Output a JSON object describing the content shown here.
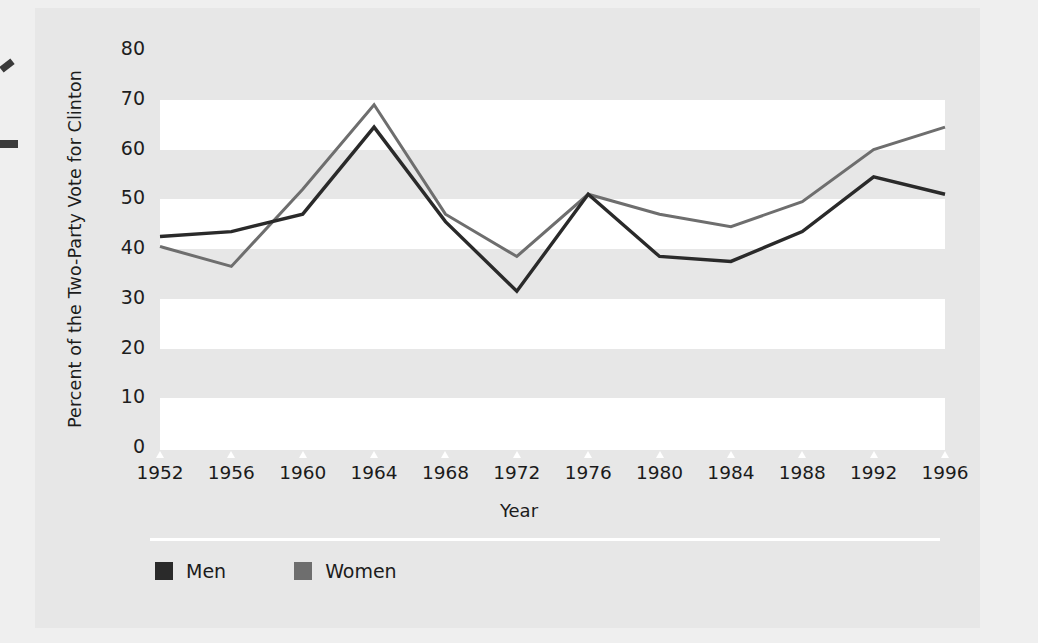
{
  "figure": {
    "background_color": "#e7e7e7",
    "band_color": "#ffffff",
    "axis_color": "#ffffff"
  },
  "legend": {
    "position": "bottom-left",
    "items": [
      {
        "label": "Men",
        "color": "#2a2a2a"
      },
      {
        "label": "Women",
        "color": "#6e6e6e"
      }
    ]
  },
  "chart_data": {
    "type": "line",
    "title": "",
    "subtitle": "",
    "xlabel": "Year",
    "ylabel": "Percent of the Two-Party Vote for Clinton",
    "categories": [
      "1952",
      "1956",
      "1960",
      "1964",
      "1968",
      "1972",
      "1976",
      "1980",
      "1984",
      "1988",
      "1992",
      "1996"
    ],
    "x": [
      1952,
      1956,
      1960,
      1964,
      1968,
      1972,
      1976,
      1980,
      1984,
      1988,
      1992,
      1996
    ],
    "xlim": [
      1952,
      1996
    ],
    "ylim": [
      0,
      80
    ],
    "yticks": [
      0,
      10,
      20,
      30,
      40,
      50,
      60,
      70,
      80
    ],
    "ytick_labels": [
      "0",
      "10",
      "20",
      "30",
      "40",
      "50",
      "60",
      "70",
      "80"
    ],
    "grid": "horizontal-alternating-bands",
    "legend_position": "bottom-left",
    "series": [
      {
        "name": "Men",
        "color": "#2a2a2a",
        "values": [
          42.5,
          43.5,
          47.0,
          64.5,
          45.5,
          31.5,
          51.0,
          38.5,
          37.5,
          43.5,
          54.5,
          51.0
        ]
      },
      {
        "name": "Women",
        "color": "#6e6e6e",
        "values": [
          40.5,
          36.5,
          52.0,
          69.0,
          47.0,
          38.5,
          51.0,
          47.0,
          44.5,
          49.5,
          60.0,
          64.5
        ]
      }
    ]
  }
}
